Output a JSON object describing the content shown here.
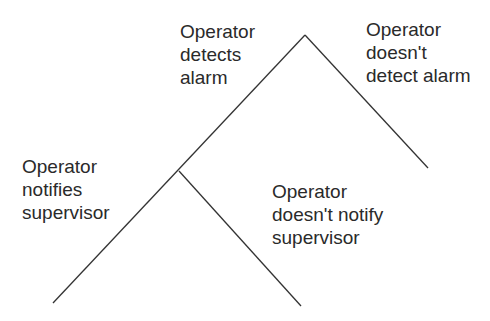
{
  "diagram": {
    "type": "event-tree",
    "line_color": "#333333",
    "nodes": {
      "root": {
        "x": 305,
        "y": 35
      },
      "branch_point": {
        "x": 179,
        "y": 171
      }
    },
    "labels": {
      "detects": {
        "lines": [
          "Operator",
          "detects",
          "alarm"
        ]
      },
      "not_detect": {
        "lines": [
          "Operator",
          "doesn't",
          "detect alarm"
        ]
      },
      "notifies": {
        "lines": [
          "Operator",
          "notifies",
          "supervisor"
        ]
      },
      "not_notify": {
        "lines": [
          "Operator",
          "doesn't notify",
          "supervisor"
        ]
      }
    }
  }
}
